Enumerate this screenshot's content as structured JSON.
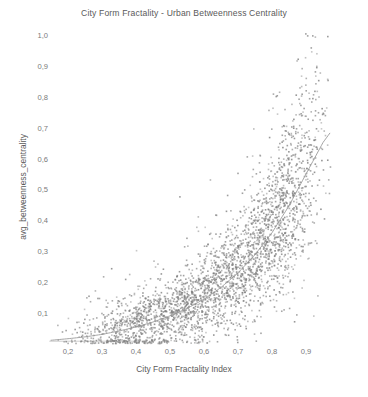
{
  "chart_data": {
    "type": "scatter",
    "title": "City Form Fractality - Urban Betweenness Centrality",
    "xlabel": "City Form Fractality Index",
    "ylabel": "avg_betweenness_centrality",
    "xlim": [
      0.13,
      1.0
    ],
    "ylim": [
      0.0,
      1.03
    ],
    "grid": false,
    "legend": null,
    "xticks": [
      "0,2",
      "0,3",
      "0,4",
      "0,5",
      "0,6",
      "0,7",
      "0,8",
      "0,9"
    ],
    "xtick_values": [
      0.2,
      0.3,
      0.4,
      0.5,
      0.6,
      0.7,
      0.8,
      0.9
    ],
    "yticks": [
      "0,1",
      "0,2",
      "0,3",
      "0,4",
      "0,5",
      "0,6",
      "0,7",
      "0,8",
      "0,9",
      "1,0"
    ],
    "ytick_values": [
      0.1,
      0.2,
      0.3,
      0.4,
      0.5,
      0.6,
      0.7,
      0.8,
      0.9,
      1.0
    ],
    "decimal_separator": ",",
    "point_color": "#808080",
    "point_size_px": 1.6,
    "point_count": 3000,
    "fit_line": {
      "visible": true,
      "color": "#9a9a9a",
      "type": "exponential-trend",
      "x_start": 0.15,
      "x_end": 0.97,
      "y_start": 0.015,
      "y_end": 0.685
    },
    "trend_description": "avg_betweenness_centrality grows exponentially with City Form Fractality Index; scatter spread widens at high index values",
    "trend_points": [
      {
        "x": 0.15,
        "y": 0.015
      },
      {
        "x": 0.2,
        "y": 0.02
      },
      {
        "x": 0.25,
        "y": 0.026
      },
      {
        "x": 0.3,
        "y": 0.034
      },
      {
        "x": 0.35,
        "y": 0.045
      },
      {
        "x": 0.4,
        "y": 0.058
      },
      {
        "x": 0.45,
        "y": 0.074
      },
      {
        "x": 0.5,
        "y": 0.094
      },
      {
        "x": 0.55,
        "y": 0.118
      },
      {
        "x": 0.6,
        "y": 0.148
      },
      {
        "x": 0.65,
        "y": 0.186
      },
      {
        "x": 0.7,
        "y": 0.233
      },
      {
        "x": 0.75,
        "y": 0.292
      },
      {
        "x": 0.8,
        "y": 0.363
      },
      {
        "x": 0.85,
        "y": 0.45
      },
      {
        "x": 0.9,
        "y": 0.553
      },
      {
        "x": 0.95,
        "y": 0.655
      },
      {
        "x": 0.97,
        "y": 0.685
      }
    ],
    "outliers": [
      {
        "x": 0.905,
        "y": 1.0
      },
      {
        "x": 0.92,
        "y": 1.0
      },
      {
        "x": 0.885,
        "y": 0.775
      },
      {
        "x": 0.845,
        "y": 0.645
      },
      {
        "x": 0.905,
        "y": 0.64
      },
      {
        "x": 0.93,
        "y": 0.64
      },
      {
        "x": 0.82,
        "y": 0.59
      },
      {
        "x": 0.7,
        "y": 0.555
      },
      {
        "x": 0.76,
        "y": 0.49
      },
      {
        "x": 0.635,
        "y": 0.42
      }
    ]
  }
}
